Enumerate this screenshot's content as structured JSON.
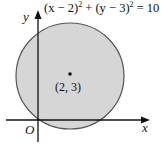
{
  "figure": {
    "equation": {
      "text": "(x − 2)² + (y − 3)² = 10",
      "parts": [
        "(x − 2)",
        "2",
        " + (y − 3)",
        "2",
        " = 10"
      ]
    },
    "axes": {
      "x_label": "x",
      "y_label": "y",
      "origin_label": "O"
    },
    "center": {
      "label": "(2, 3)",
      "x": 2,
      "y": 3
    },
    "circle": {
      "radius_squared": 10,
      "fill_color": "#d6d6d6",
      "stroke_color": "#444444"
    },
    "colors": {
      "axis": "#111111",
      "text": "#111111",
      "background": "#ffffff"
    }
  }
}
